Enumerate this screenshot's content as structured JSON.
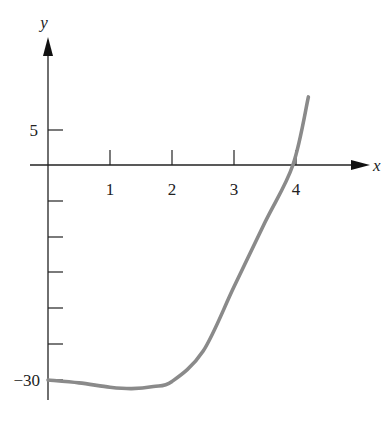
{
  "chart_data": {
    "type": "line",
    "title": "",
    "xlabel": "x",
    "ylabel": "y",
    "x_ticks": [
      1,
      2,
      3,
      4
    ],
    "x_tick_labels": [
      "1",
      "2",
      "3",
      "4"
    ],
    "y_ticks": [
      5,
      0,
      -5,
      -10,
      -15,
      -20,
      -25,
      -30
    ],
    "y_tick_labels_shown": [
      "5",
      "−30"
    ],
    "xlim": [
      0,
      4.6
    ],
    "ylim": [
      -33,
      15
    ],
    "grid": false,
    "legend": null,
    "series": [
      {
        "name": "f(x)",
        "color": "#8a8a8a",
        "x": [
          0,
          0.5,
          1.0,
          1.35,
          1.7,
          2.0,
          2.5,
          3.0,
          3.5,
          3.95,
          4.2
        ],
        "y": [
          -30,
          -30.4,
          -31,
          -31.2,
          -30.9,
          -30.2,
          -26,
          -17,
          -8,
          0,
          9.5
        ]
      }
    ]
  }
}
